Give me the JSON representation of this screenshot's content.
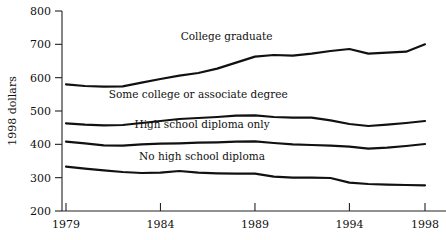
{
  "chart_data": {
    "type": "line",
    "title": "",
    "subtitle": "",
    "xlabel": "",
    "ylabel": "1998 dollars",
    "xlim": [
      1979,
      1998
    ],
    "ylim": [
      200,
      800
    ],
    "ytick_values": [
      200,
      300,
      400,
      500,
      600,
      700,
      800
    ],
    "ytick_labels": [
      "200",
      "300",
      "400",
      "500",
      "600",
      "700",
      "800"
    ],
    "xtick_values": [
      1979,
      1984,
      1989,
      1994,
      1998
    ],
    "xtick_labels": [
      "1979",
      "1984",
      "1989",
      "1994",
      "1998"
    ],
    "grid": false,
    "legend_position": "inline-labels",
    "x": [
      1979,
      1980,
      1981,
      1982,
      1983,
      1984,
      1985,
      1986,
      1987,
      1988,
      1989,
      1990,
      1991,
      1992,
      1993,
      1994,
      1995,
      1996,
      1997,
      1998
    ],
    "series": [
      {
        "name": "College graduate",
        "label": "College graduate",
        "values": [
          580,
          575,
          573,
          574,
          585,
          596,
          606,
          614,
          627,
          645,
          663,
          668,
          666,
          672,
          680,
          686,
          672,
          675,
          678,
          700
        ]
      },
      {
        "name": "Some college or associate degree",
        "label": "Some college or associate degree",
        "values": [
          463,
          459,
          457,
          458,
          464,
          470,
          476,
          479,
          482,
          486,
          487,
          482,
          480,
          480,
          472,
          461,
          455,
          459,
          464,
          470
        ]
      },
      {
        "name": "High school diploma only",
        "label": "High school diploma only",
        "values": [
          408,
          403,
          397,
          396,
          400,
          402,
          403,
          405,
          406,
          408,
          409,
          404,
          400,
          398,
          396,
          393,
          387,
          390,
          395,
          401
        ]
      },
      {
        "name": "No high school diploma",
        "label": "No high school diploma",
        "values": [
          333,
          327,
          322,
          317,
          314,
          315,
          320,
          315,
          313,
          312,
          312,
          303,
          300,
          300,
          299,
          285,
          281,
          279,
          278,
          277
        ]
      }
    ],
    "label_positions": [
      {
        "name": "College graduate",
        "x": 1987.5,
        "y": 712
      },
      {
        "name": "Some college or associate degree",
        "x": 1986.0,
        "y": 540
      },
      {
        "name": "High school diploma only",
        "x": 1986.2,
        "y": 450
      },
      {
        "name": "No high school diploma",
        "x": 1986.2,
        "y": 352
      }
    ]
  },
  "axis": {
    "y_title": "1998 dollars",
    "y_ticks": [
      "800",
      "700",
      "600",
      "500",
      "400",
      "300",
      "200"
    ],
    "x_ticks": [
      "1979",
      "1984",
      "1989",
      "1994",
      "1998"
    ]
  },
  "colors": {
    "line": "#111111",
    "axis": "#222222",
    "text": "#111111",
    "background": "#ffffff"
  }
}
